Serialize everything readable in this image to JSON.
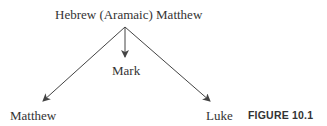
{
  "diagram": {
    "source": "Hebrew (Aramaic) Matthew",
    "nodes": [
      {
        "id": "mark",
        "label": "Mark"
      },
      {
        "id": "matthew",
        "label": "Matthew"
      },
      {
        "id": "luke",
        "label": "Luke"
      }
    ],
    "edges": [
      {
        "from": "Hebrew (Aramaic) Matthew",
        "to": "Mark"
      },
      {
        "from": "Hebrew (Aramaic) Matthew",
        "to": "Matthew"
      },
      {
        "from": "Hebrew (Aramaic) Matthew",
        "to": "Luke"
      }
    ],
    "caption": "FIGURE 10.1",
    "colors": {
      "line": "#444444",
      "text": "#333333"
    }
  }
}
